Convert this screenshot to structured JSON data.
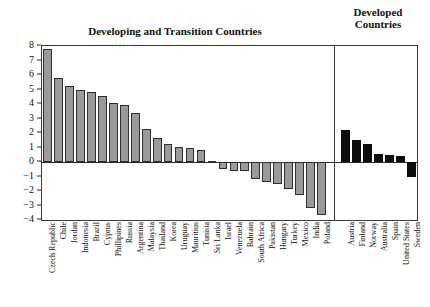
{
  "chart_data": {
    "type": "bar",
    "title": "Developing and Transition Countries",
    "title_secondary": "Developed Countries",
    "xlabel": "",
    "ylabel": "",
    "ylim": [
      -4,
      8
    ],
    "yticks": [
      8,
      7,
      6,
      5,
      4,
      3,
      2,
      1,
      0,
      -1,
      -2,
      -3,
      -4
    ],
    "ytick_labels": [
      "8",
      "7",
      "6",
      "5",
      "4",
      "3",
      "2",
      "1",
      "0",
      "−1",
      "−2",
      "−3",
      "−4"
    ],
    "grid": false,
    "legend": "none",
    "groups": [
      {
        "name": "Developing and Transition Countries",
        "color": "#9a9a9a",
        "categories": [
          "Czech Republic",
          "Chile",
          "Jordan",
          "Indonesia",
          "Brazil",
          "Cyprus",
          "Phillipines",
          "Russia",
          "Argentina",
          "Malaysia",
          "Thailand",
          "Korea",
          "Uruguay",
          "Mauritius",
          "Tunisia",
          "Sri Lanka",
          "Israel",
          "Venezuela",
          "Bahrain",
          "South Africa",
          "Pakistan",
          "Hungary",
          "Turkey",
          "Mexico",
          "India",
          "Poland"
        ],
        "values": [
          7.8,
          5.8,
          5.25,
          4.95,
          4.8,
          4.55,
          4.1,
          3.95,
          3.35,
          2.3,
          1.65,
          1.25,
          1.05,
          1.0,
          0.8,
          0.1,
          -0.45,
          -0.6,
          -0.65,
          -1.15,
          -1.35,
          -1.55,
          -1.85,
          -2.25,
          -3.15,
          -3.65
        ]
      },
      {
        "name": "Developed Countries",
        "color": "#0d0d0d",
        "categories": [
          "Austria",
          "Finland",
          "Norway",
          "Australia",
          "Spain",
          "United States",
          "Sweden"
        ],
        "values": [
          2.2,
          1.55,
          1.25,
          0.55,
          0.45,
          0.4,
          -1.05
        ]
      }
    ]
  }
}
